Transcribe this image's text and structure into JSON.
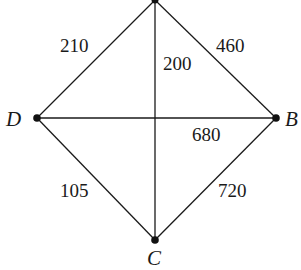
{
  "diagram": {
    "type": "weighted-graph",
    "vertices": [
      {
        "id": "A",
        "label": "",
        "x": 155,
        "y": 0
      },
      {
        "id": "B",
        "label": "B",
        "x": 276,
        "y": 118
      },
      {
        "id": "C",
        "label": "C",
        "x": 155,
        "y": 240
      },
      {
        "id": "D",
        "label": "D",
        "x": 37,
        "y": 118
      }
    ],
    "edges": [
      {
        "from": "A",
        "to": "D",
        "weight": "210"
      },
      {
        "from": "A",
        "to": "B",
        "weight": "460"
      },
      {
        "from": "A",
        "to": "C",
        "weight": "200"
      },
      {
        "from": "D",
        "to": "B",
        "weight": "680"
      },
      {
        "from": "D",
        "to": "C",
        "weight": "105"
      },
      {
        "from": "B",
        "to": "C",
        "weight": "720"
      }
    ],
    "labels": {
      "vertex_b": "B",
      "vertex_c": "C",
      "vertex_d": "D",
      "w_ad": "210",
      "w_ab": "460",
      "w_ac": "200",
      "w_db": "680",
      "w_dc": "105",
      "w_bc": "720"
    }
  }
}
